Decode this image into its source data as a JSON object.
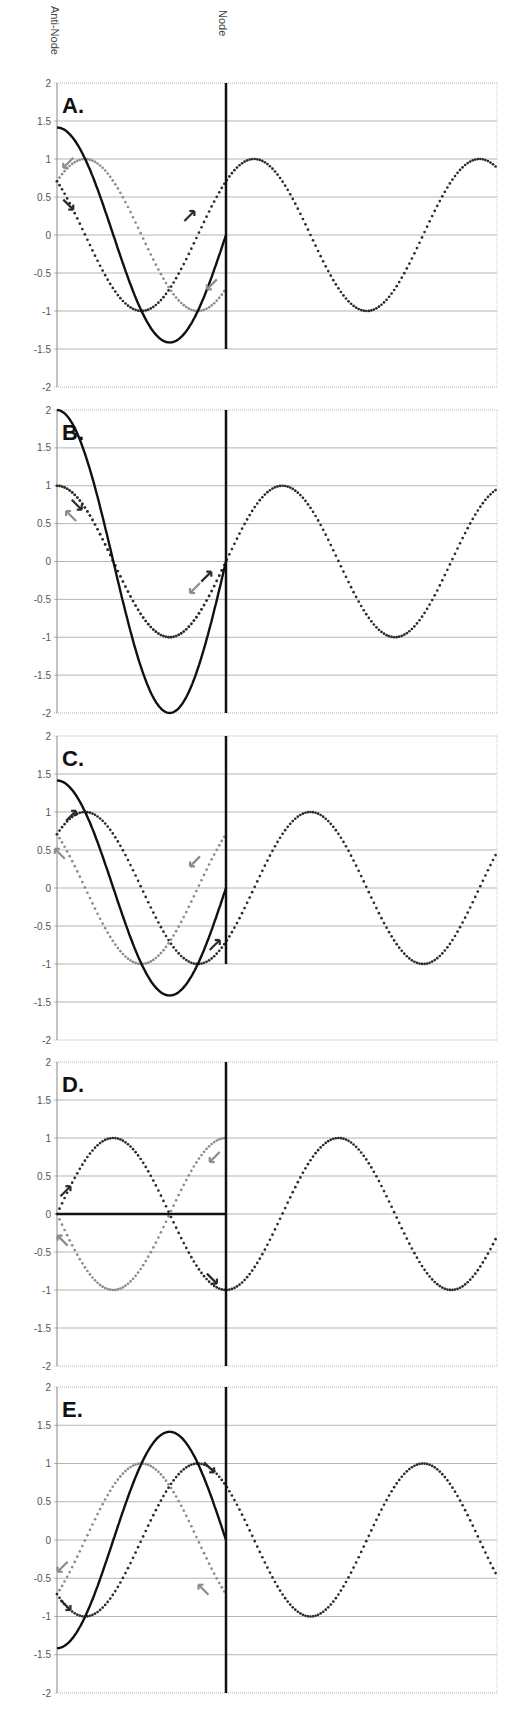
{
  "header": {
    "antinode_label": "Anti-Node",
    "node_label": "Node"
  },
  "layout": {
    "x_left_px": 57,
    "x_right_px": 497,
    "node_px": 226,
    "units_to_node": 3,
    "wavelength_units": 4
  },
  "colors": {
    "incident": "#2b2b2b",
    "reflected": "#8c8c8c",
    "standing": "#111111",
    "grid": "#b5b5b5",
    "node_line": "#111111"
  },
  "chart_data": [
    {
      "type": "line",
      "panel": "A.",
      "title": "A.",
      "ylim": [
        -2,
        2
      ],
      "yticks": [
        "2",
        "1.5",
        "1",
        "0.5",
        "0",
        "-0.5",
        "-1",
        "-1.5",
        "-2"
      ],
      "top_px": 83,
      "bottom_px": 387,
      "node_line_to": -1.5,
      "series": [
        {
          "name": "incident (dark dotted)",
          "phase_deg": 45,
          "amplitude": 1,
          "extends_past_node": true
        },
        {
          "name": "reflected (gray dotted)",
          "phase_deg": -45,
          "amplitude": 1,
          "extends_past_node": false
        },
        {
          "name": "standing (solid)",
          "amplitude_at_antinode": 1.414
        }
      ],
      "arrows": [
        {
          "x": 0.2,
          "y": 0.95,
          "dir": "down-left",
          "color": "reflected"
        },
        {
          "x": 0.2,
          "y": 0.4,
          "dir": "down-right",
          "color": "incident"
        },
        {
          "x": 2.35,
          "y": 0.25,
          "dir": "up-right",
          "color": "incident"
        },
        {
          "x": 2.75,
          "y": -0.65,
          "dir": "down-left",
          "color": "reflected"
        }
      ]
    },
    {
      "type": "line",
      "panel": "B.",
      "title": "B.",
      "ylim": [
        -2,
        2
      ],
      "yticks": [
        "2",
        "1.5",
        "1",
        "0.5",
        "0",
        "-0.5",
        "-1",
        "-1.5",
        "-2"
      ],
      "top_px": 410,
      "bottom_px": 713,
      "node_line_to": -2,
      "series": [
        {
          "name": "incident (dark dotted)",
          "phase_deg": 0,
          "amplitude": 1,
          "extends_past_node": true
        },
        {
          "name": "reflected (gray dotted)",
          "phase_deg": 0,
          "amplitude": 1,
          "extends_past_node": false
        },
        {
          "name": "standing (solid)",
          "amplitude_at_antinode": 2
        }
      ],
      "arrows": [
        {
          "x": 0.35,
          "y": 0.75,
          "dir": "down-right",
          "color": "incident"
        },
        {
          "x": 0.25,
          "y": 0.6,
          "dir": "up-left",
          "color": "reflected"
        },
        {
          "x": 2.65,
          "y": -0.2,
          "dir": "up-right",
          "color": "incident"
        },
        {
          "x": 2.45,
          "y": -0.35,
          "dir": "down-left",
          "color": "reflected"
        }
      ]
    },
    {
      "type": "line",
      "panel": "C.",
      "title": "C.",
      "ylim": [
        -2,
        2
      ],
      "yticks": [
        "2",
        "1.5",
        "1",
        "0.5",
        "0",
        "-0.5",
        "-1",
        "-1.5",
        "-2"
      ],
      "top_px": 736,
      "bottom_px": 1040,
      "node_line_to": -1,
      "series": [
        {
          "name": "incident (dark dotted)",
          "phase_deg": -45,
          "amplitude": 1,
          "extends_past_node": true
        },
        {
          "name": "reflected (gray dotted)",
          "phase_deg": 45,
          "amplitude": 1,
          "extends_past_node": false
        },
        {
          "name": "standing (solid)",
          "amplitude_at_antinode": 1.414
        }
      ],
      "arrows": [
        {
          "x": 0.25,
          "y": 0.95,
          "dir": "up-right",
          "color": "incident"
        },
        {
          "x": 0.05,
          "y": 0.45,
          "dir": "up-left",
          "color": "reflected"
        },
        {
          "x": 2.45,
          "y": 0.35,
          "dir": "down-left",
          "color": "reflected"
        },
        {
          "x": 2.8,
          "y": -0.75,
          "dir": "up-right",
          "color": "incident"
        }
      ]
    },
    {
      "type": "line",
      "panel": "D.",
      "title": "D.",
      "ylim": [
        -2,
        2
      ],
      "yticks": [
        "2",
        "1.5",
        "1",
        "0.5",
        "0",
        "-0.5",
        "-1",
        "-1.5",
        "-2"
      ],
      "top_px": 1062,
      "bottom_px": 1366,
      "node_line_to": -2,
      "series": [
        {
          "name": "incident (dark dotted)",
          "phase_deg": -90,
          "amplitude": 1,
          "extends_past_node": true
        },
        {
          "name": "reflected (gray dotted)",
          "phase_deg": 90,
          "amplitude": 1,
          "extends_past_node": false
        },
        {
          "name": "standing (solid)",
          "amplitude_at_antinode": 0
        }
      ],
      "arrows": [
        {
          "x": 0.15,
          "y": 0.3,
          "dir": "up-right",
          "color": "incident"
        },
        {
          "x": 0.1,
          "y": -0.35,
          "dir": "up-left",
          "color": "reflected"
        },
        {
          "x": 2.8,
          "y": 0.75,
          "dir": "down-left",
          "color": "reflected"
        },
        {
          "x": 2.75,
          "y": -0.85,
          "dir": "down-right",
          "color": "incident"
        }
      ]
    },
    {
      "type": "line",
      "panel": "E.",
      "title": "E.",
      "ylim": [
        -2,
        2
      ],
      "yticks": [
        "2",
        "1.5",
        "1",
        "0.5",
        "0",
        "-0.5",
        "-1",
        "-1.5",
        "-2"
      ],
      "top_px": 1387,
      "bottom_px": 1693,
      "node_line_to": -2,
      "series": [
        {
          "name": "incident (dark dotted)",
          "phase_deg": 135,
          "amplitude": 1,
          "extends_past_node": true
        },
        {
          "name": "reflected (gray dotted)",
          "phase_deg": -135,
          "amplitude": 1,
          "extends_past_node": false
        },
        {
          "name": "standing (solid)",
          "amplitude_at_antinode": -1.414
        }
      ],
      "arrows": [
        {
          "x": 0.1,
          "y": -0.35,
          "dir": "down-left",
          "color": "reflected"
        },
        {
          "x": 0.15,
          "y": -0.85,
          "dir": "down-right",
          "color": "incident"
        },
        {
          "x": 2.7,
          "y": 0.95,
          "dir": "down-right",
          "color": "incident"
        },
        {
          "x": 2.6,
          "y": -0.65,
          "dir": "up-left",
          "color": "reflected"
        }
      ]
    }
  ]
}
